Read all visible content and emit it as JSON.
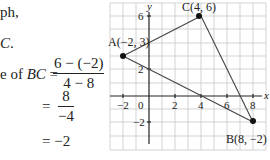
{
  "text": {
    "line1": "ph,",
    "line2_var": "C",
    "line2_punct": ".",
    "slope_prefix": "e of ",
    "slope_var": "BC",
    "equals": "=",
    "frac1_num": "6 − (−2)",
    "frac1_den": "4 − 8",
    "frac2_num": "8",
    "frac2_den": "−4",
    "result": "= −2"
  },
  "graph": {
    "axis_labels": {
      "x": "x",
      "y": "y"
    },
    "x_ticks": [
      "−2",
      "0",
      "2",
      "4",
      "6",
      "8"
    ],
    "y_ticks": [
      "6",
      "2",
      "−2"
    ],
    "points": [
      {
        "name": "A",
        "label": "A(−2, 3)",
        "x": -2,
        "y": 3
      },
      {
        "name": "B",
        "label": "B(8, −2)",
        "x": 8,
        "y": -2
      },
      {
        "name": "C",
        "label": "C(4, 6)",
        "x": 4,
        "y": 6
      }
    ],
    "grid_color": "#c8c8c8",
    "axis_color": "#222222",
    "line_color": "#444444"
  }
}
